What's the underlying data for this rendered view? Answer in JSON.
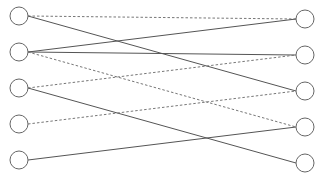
{
  "diagram": {
    "type": "bipartite-graph",
    "node_radius": 9,
    "colors": {
      "node_stroke": "#666666",
      "edge_solid": "#555555",
      "edge_dashed": "#777777",
      "background": "#ffffff"
    },
    "left_nodes": [
      {
        "id": "L1",
        "x": 19,
        "y": 16
      },
      {
        "id": "L2",
        "x": 19,
        "y": 52
      },
      {
        "id": "L3",
        "x": 19,
        "y": 88
      },
      {
        "id": "L4",
        "x": 19,
        "y": 124
      },
      {
        "id": "L5",
        "x": 19,
        "y": 160
      }
    ],
    "right_nodes": [
      {
        "id": "R1",
        "x": 305,
        "y": 19
      },
      {
        "id": "R2",
        "x": 305,
        "y": 55
      },
      {
        "id": "R3",
        "x": 305,
        "y": 91
      },
      {
        "id": "R4",
        "x": 305,
        "y": 127
      },
      {
        "id": "R5",
        "x": 305,
        "y": 163
      }
    ],
    "edges": [
      {
        "from": "L1",
        "to": "R1",
        "style": "dashed"
      },
      {
        "from": "L1",
        "to": "R3",
        "style": "solid"
      },
      {
        "from": "L2",
        "to": "R1",
        "style": "solid"
      },
      {
        "from": "L2",
        "to": "R2",
        "style": "solid"
      },
      {
        "from": "L2",
        "to": "R4",
        "style": "dashed"
      },
      {
        "from": "L3",
        "to": "R2",
        "style": "dashed"
      },
      {
        "from": "L3",
        "to": "R5",
        "style": "solid"
      },
      {
        "from": "L4",
        "to": "R3",
        "style": "dashed"
      },
      {
        "from": "L5",
        "to": "R4",
        "style": "solid"
      }
    ]
  }
}
